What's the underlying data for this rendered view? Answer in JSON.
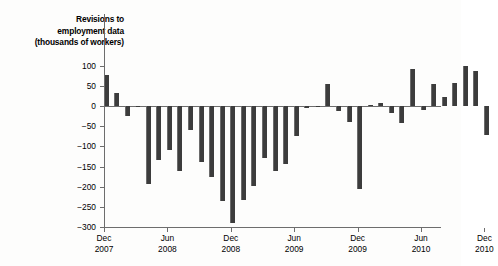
{
  "chart_data": {
    "type": "bar",
    "title": "Revisions to employment data (thousands of workers)",
    "title_lines": [
      "Revisions to",
      "employment data",
      "(thousands of workers)"
    ],
    "xlabel": "",
    "ylabel": "thousands of workers",
    "ylim": [
      -300,
      110
    ],
    "yticks": [
      100,
      50,
      0,
      -50,
      -100,
      -150,
      -200,
      -250,
      -300
    ],
    "ytick_labels": [
      "100",
      "50",
      "0",
      "−50",
      "−100",
      "−150",
      "−200",
      "−250",
      "−300"
    ],
    "xtick_labels": [
      {
        "month": "Dec",
        "year": "2007"
      },
      {
        "month": "Jun",
        "year": "2008"
      },
      {
        "month": "Dec",
        "year": "2008"
      },
      {
        "month": "Jun",
        "year": "2009"
      },
      {
        "month": "Dec",
        "year": "2009"
      },
      {
        "month": "Jun",
        "year": "2010"
      },
      {
        "month": "Dec",
        "year": "2010"
      }
    ],
    "grid": false,
    "legend": false,
    "bar_color": "#3c3c3c",
    "categories": [
      "Dec 2007",
      "Jan 2008",
      "Feb 2008",
      "Mar 2008",
      "Apr 2008",
      "May 2008",
      "Jun 2008",
      "Jul 2008",
      "Aug 2008",
      "Sep 2008",
      "Oct 2008",
      "Nov 2008",
      "Dec 2008",
      "Jan 2009",
      "Feb 2009",
      "Mar 2009",
      "Apr 2009",
      "May 2009",
      "Jun 2009",
      "Jul 2009",
      "Aug 2009",
      "Sep 2009",
      "Oct 2009",
      "Nov 2009",
      "Dec 2009",
      "Jan 2010",
      "Feb 2010",
      "Mar 2010",
      "Apr 2010",
      "May 2010",
      "Jun 2010",
      "Jul 2010",
      "Aug 2010",
      "Sep 2010",
      "Oct 2010",
      "Nov 2010",
      "Dec 2010"
    ],
    "values": [
      78,
      32,
      -25,
      -3,
      -193,
      -135,
      -110,
      -160,
      -60,
      -140,
      -175,
      -235,
      -290,
      -232,
      -198,
      -130,
      -160,
      -143,
      -75,
      -5,
      -3,
      55,
      -12,
      -40,
      -205,
      3,
      8,
      -18,
      -42,
      92,
      -10,
      55,
      22,
      57,
      98,
      88,
      -72
    ]
  }
}
